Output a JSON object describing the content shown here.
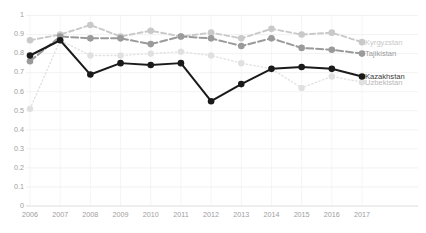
{
  "chart_data": {
    "type": "line",
    "title": "",
    "subtitle": "",
    "xlabel": "",
    "ylabel": "",
    "grid": true,
    "legend_position": "right-inline-end-labels",
    "x": [
      2006,
      2007,
      2008,
      2009,
      2010,
      2011,
      2012,
      2013,
      2014,
      2015,
      2016,
      2017
    ],
    "xticklabels": [
      "2006",
      "2007",
      "2008",
      "2009",
      "2010",
      "2011",
      "2012",
      "2013",
      "2014",
      "2015",
      "2016",
      "2017"
    ],
    "yticklabels": [
      "1",
      "0.9",
      "0.8",
      "0.7",
      "0.6",
      "0.5",
      "0.4",
      "0.3",
      "0.2",
      "0.1",
      "0"
    ],
    "yticks": [
      1,
      0.9,
      0.8,
      0.7,
      0.6,
      0.5,
      0.4,
      0.3,
      0.2,
      0.1,
      0
    ],
    "ylim": [
      0,
      1
    ],
    "xlim": [
      2006,
      2017
    ],
    "series": [
      {
        "name": "Kazakhstan",
        "color": "#1a1a1a",
        "style": "solid",
        "values": [
          0.79,
          0.87,
          0.69,
          0.75,
          0.74,
          0.75,
          0.55,
          0.64,
          0.72,
          0.73,
          0.72,
          0.68
        ]
      },
      {
        "name": "Kyrgyzstan",
        "color": "#c9c9c9",
        "style": "dashed",
        "values": [
          0.87,
          0.9,
          0.95,
          0.89,
          0.92,
          0.89,
          0.91,
          0.88,
          0.93,
          0.9,
          0.91,
          0.86
        ]
      },
      {
        "name": "Tajikistan",
        "color": "#9a9a9a",
        "style": "longdash",
        "values": [
          0.76,
          0.89,
          0.88,
          0.88,
          0.85,
          0.89,
          0.88,
          0.84,
          0.88,
          0.83,
          0.82,
          0.8
        ]
      },
      {
        "name": "Uzbekistan",
        "color": "#e0e0e0",
        "style": "dotted",
        "values": [
          0.51,
          0.87,
          0.79,
          0.79,
          0.8,
          0.81,
          0.79,
          0.75,
          0.72,
          0.62,
          0.68,
          0.65
        ]
      }
    ]
  },
  "axis": {
    "y_labels": [
      "1",
      "0.9",
      "0.8",
      "0.7",
      "0.6",
      "0.5",
      "0.4",
      "0.3",
      "0.2",
      "0.1",
      "0"
    ],
    "x_labels": [
      "2006",
      "2007",
      "2008",
      "2009",
      "2010",
      "2011",
      "2012",
      "2013",
      "2014",
      "2015",
      "2016",
      "2017"
    ]
  },
  "series_end_labels": [
    {
      "name": "Kyrgyzstan"
    },
    {
      "name": "Tajikistan"
    },
    {
      "name": "Kazakhstan"
    },
    {
      "name": "Uzbekistan"
    }
  ]
}
